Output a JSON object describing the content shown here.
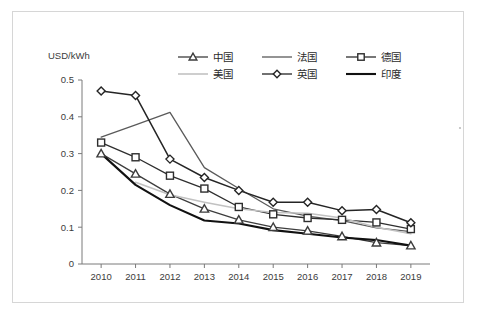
{
  "chart_data": {
    "type": "line",
    "title": "",
    "xlabel": "",
    "ylabel": "USD/kWh",
    "unit_label": "USD/kWh",
    "categories": [
      "2010",
      "2011",
      "2012",
      "2013",
      "2014",
      "2015",
      "2016",
      "2017",
      "2018",
      "2019"
    ],
    "x": [
      2010,
      2011,
      2012,
      2013,
      2014,
      2015,
      2016,
      2017,
      2018,
      2019
    ],
    "ylim": [
      0,
      0.5
    ],
    "ytick_labels": [
      "0",
      "0.1",
      "0.2",
      "0.3",
      "0.4",
      "0.5"
    ],
    "ytick_values": [
      0,
      0.1,
      0.2,
      0.3,
      0.4,
      0.5
    ],
    "grid": false,
    "legend_position": "top",
    "series": [
      {
        "name": "中国",
        "marker": "triangle",
        "color": "#3d3d3d",
        "width": 1.3,
        "values": [
          0.3,
          0.245,
          0.19,
          0.15,
          0.12,
          0.1,
          0.09,
          0.075,
          0.058,
          0.05
        ]
      },
      {
        "name": "法国",
        "marker": "none",
        "color": "#5a5a5a",
        "width": 1.3,
        "values": [
          0.345,
          0.378,
          0.412,
          0.262,
          0.205,
          0.15,
          0.13,
          0.118,
          0.098,
          0.088
        ]
      },
      {
        "name": "德国",
        "marker": "square",
        "color": "#2e2e2e",
        "width": 1.3,
        "values": [
          0.33,
          0.29,
          0.24,
          0.205,
          0.155,
          0.135,
          0.125,
          0.12,
          0.113,
          0.095
        ]
      },
      {
        "name": "美国",
        "marker": "none",
        "color": "#c2c2c2",
        "width": 1.6,
        "values": [
          null,
          0.222,
          0.188,
          0.168,
          0.15,
          0.14,
          0.138,
          0.125,
          0.1,
          0.082
        ]
      },
      {
        "name": "英国",
        "marker": "diamond",
        "color": "#252525",
        "width": 1.5,
        "values": [
          0.47,
          0.458,
          0.285,
          0.235,
          0.2,
          0.168,
          0.168,
          0.145,
          0.148,
          0.112
        ]
      },
      {
        "name": "印度",
        "marker": "none",
        "color": "#111111",
        "width": 2.1,
        "values": [
          0.3,
          0.215,
          0.16,
          0.118,
          0.11,
          0.092,
          0.082,
          0.072,
          0.065,
          0.05
        ]
      }
    ],
    "legend": [
      {
        "label": "中国",
        "marker": "triangle",
        "color": "#3d3d3d"
      },
      {
        "label": "法国",
        "marker": "none",
        "color": "#5a5a5a"
      },
      {
        "label": "德国",
        "marker": "square",
        "color": "#2e2e2e"
      },
      {
        "label": "美国",
        "marker": "none",
        "color": "#c2c2c2"
      },
      {
        "label": "英国",
        "marker": "diamond",
        "color": "#252525"
      },
      {
        "label": "印度",
        "marker": "none",
        "color": "#111111"
      }
    ]
  }
}
